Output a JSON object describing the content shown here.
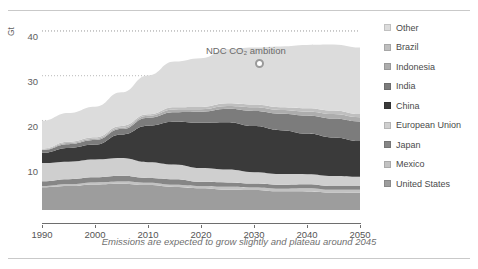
{
  "chart_data": {
    "type": "area",
    "stacked": true,
    "title": "",
    "xlabel": "",
    "ylabel": "Gt",
    "xlim": [
      1990,
      2050
    ],
    "ylim": [
      0,
      42
    ],
    "xticks": [
      1990,
      2000,
      2010,
      2020,
      2030,
      2040,
      2050
    ],
    "yticks": [
      10,
      20,
      30,
      40
    ],
    "grid": "horizontal-dotted",
    "legend_position": "right",
    "x": [
      1990,
      1995,
      2000,
      2005,
      2010,
      2015,
      2020,
      2025,
      2030,
      2035,
      2040,
      2045,
      2050
    ],
    "series": [
      {
        "name": "United States",
        "color": "#9d9d9d",
        "values": [
          5.0,
          5.3,
          5.8,
          5.9,
          5.5,
          5.2,
          4.8,
          4.6,
          4.4,
          4.2,
          4.1,
          4.0,
          3.9
        ]
      },
      {
        "name": "Mexico",
        "color": "#c2c2c2",
        "values": [
          0.35,
          0.4,
          0.45,
          0.5,
          0.52,
          0.55,
          0.56,
          0.58,
          0.6,
          0.62,
          0.63,
          0.64,
          0.65
        ]
      },
      {
        "name": "Japan",
        "color": "#868686",
        "values": [
          1.05,
          1.15,
          1.2,
          1.22,
          1.15,
          1.2,
          1.05,
          0.98,
          0.92,
          0.87,
          0.83,
          0.8,
          0.78
        ]
      },
      {
        "name": "European Union",
        "color": "#cfcfcf",
        "values": [
          4.1,
          3.95,
          3.9,
          3.95,
          3.6,
          3.35,
          3.0,
          2.8,
          2.6,
          2.45,
          2.3,
          2.2,
          2.1
        ]
      },
      {
        "name": "China",
        "color": "#3a3a3a",
        "values": [
          2.3,
          3.0,
          3.3,
          5.2,
          8.2,
          9.6,
          10.2,
          10.6,
          10.4,
          9.8,
          9.1,
          8.5,
          8.0
        ]
      },
      {
        "name": "India",
        "color": "#7c7c7c",
        "values": [
          0.6,
          0.8,
          1.0,
          1.15,
          1.7,
          2.1,
          2.5,
          2.95,
          3.35,
          3.7,
          4.0,
          4.25,
          4.45
        ]
      },
      {
        "name": "Indonesia",
        "color": "#adadad",
        "values": [
          0.2,
          0.27,
          0.3,
          0.37,
          0.45,
          0.55,
          0.62,
          0.7,
          0.78,
          0.85,
          0.92,
          0.97,
          1.0
        ]
      },
      {
        "name": "Brazil",
        "color": "#bfbfbf",
        "values": [
          0.22,
          0.27,
          0.32,
          0.35,
          0.4,
          0.47,
          0.5,
          0.55,
          0.6,
          0.64,
          0.68,
          0.71,
          0.74
        ]
      },
      {
        "name": "Other",
        "color": "#dcdcdc",
        "values": [
          6.2,
          6.4,
          6.8,
          7.6,
          8.7,
          10.1,
          10.9,
          12.0,
          12.8,
          13.6,
          14.2,
          14.7,
          14.9
        ]
      }
    ],
    "annotations": [
      {
        "name": "ndc-ambition",
        "label": "NDC CO₂ ambition",
        "x": 2030,
        "y": 36.2,
        "marker": "circle"
      }
    ],
    "caption": "Emissions are expected to grow slightly and plateau around 2045"
  },
  "axis": {
    "y_unit": "Gt",
    "y_ticks": [
      "40",
      "30",
      "20",
      "10"
    ],
    "x_ticks": [
      "1990",
      "2000",
      "2010",
      "2020",
      "2030",
      "2040",
      "2050"
    ]
  },
  "annotation": {
    "ndc_label": "NDC CO₂ ambition"
  },
  "caption": {
    "text": "Emissions are expected to grow slightly and plateau around 2045"
  },
  "legend": {
    "items": [
      {
        "label": "Other",
        "color": "#dcdcdc"
      },
      {
        "label": "Brazil",
        "color": "#bfbfbf"
      },
      {
        "label": "Indonesia",
        "color": "#adadad"
      },
      {
        "label": "India",
        "color": "#7c7c7c"
      },
      {
        "label": "China",
        "color": "#3a3a3a"
      },
      {
        "label": "European Union",
        "color": "#cfcfcf"
      },
      {
        "label": "Japan",
        "color": "#868686"
      },
      {
        "label": "Mexico",
        "color": "#c2c2c2"
      },
      {
        "label": "United States",
        "color": "#9d9d9d"
      }
    ]
  }
}
